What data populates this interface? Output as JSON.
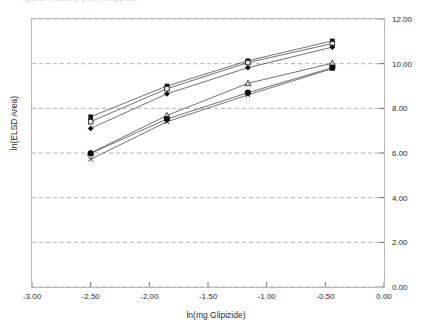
{
  "title_partial": "Figure: linearity plot (cropped)",
  "axes": {
    "x_label": "ln(mg Glipizide)",
    "y_label": "ln(ELSD Area)",
    "x_ticks": [
      "-3.00",
      "-2.50",
      "-2.00",
      "-1.50",
      "-1.00",
      "-0.50",
      "0.00"
    ],
    "y_ticks": [
      "0.00",
      "2.00",
      "4.00",
      "6.00",
      "8.00",
      "10.00",
      "12.00"
    ],
    "y_axis_side": "right"
  },
  "chart_data": {
    "type": "line",
    "title": "",
    "xlabel": "ln(mg Glipizide)",
    "ylabel": "ln(ELSD Area)",
    "xlim": [
      -3.0,
      0.0
    ],
    "ylim": [
      0.0,
      12.0
    ],
    "x_ticks": [
      -3.0,
      -2.5,
      -2.0,
      -1.5,
      -1.0,
      -0.5,
      0.0
    ],
    "y_ticks": [
      0.0,
      2.0,
      4.0,
      6.0,
      8.0,
      10.0,
      12.0
    ],
    "grid": "horizontal-dashed",
    "legend": "none",
    "x": [
      -2.5,
      -1.85,
      -1.16,
      -0.44
    ],
    "series": [
      {
        "name": "Series 1",
        "marker": "square",
        "values": [
          7.62,
          9.0,
          10.13,
          11.02
        ]
      },
      {
        "name": "Series 2",
        "marker": "square-open",
        "values": [
          7.4,
          8.88,
          10.05,
          10.9
        ]
      },
      {
        "name": "Series 3",
        "marker": "diamond",
        "values": [
          7.1,
          8.65,
          9.82,
          10.74
        ]
      },
      {
        "name": "Series 4",
        "marker": "triangle",
        "values": [
          6.0,
          7.68,
          9.12,
          10.02
        ]
      },
      {
        "name": "Series 5",
        "marker": "circle",
        "values": [
          5.98,
          7.52,
          8.7,
          9.82
        ]
      },
      {
        "name": "Series 6",
        "marker": "cross",
        "values": [
          5.72,
          7.4,
          8.6,
          9.78
        ]
      }
    ]
  }
}
